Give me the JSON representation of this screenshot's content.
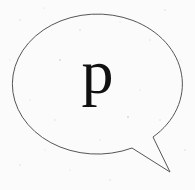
{
  "bubble": {
    "letter": "p",
    "stroke_color": "#555555",
    "background_color": "#fbfbfb",
    "text_color": "#111111"
  }
}
